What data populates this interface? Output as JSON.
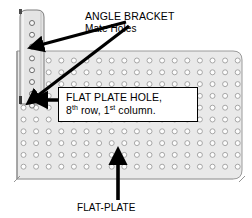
{
  "diagram": {
    "background_color": "#ffffff",
    "plate": {
      "name": "FLAT-PLATE",
      "fill_color": "#e9e9e9",
      "edge_color": "#9a9a9a",
      "hole_fill": "#fdfdfd",
      "hole_stroke": "#9d9d9d",
      "columns": 18,
      "rows": 12,
      "hole_diameter_px": 5,
      "column_spacing_px": 12.6,
      "row_spacing_px": 11.8,
      "corner_radius_px": 9
    },
    "bracket": {
      "name": "ANGLE BRACKET",
      "fill_color": "#e4e4e4",
      "edge_color": "#7d7d7d",
      "holes": 8,
      "hole_diameter_px": 5,
      "hole_spacing_px": 11.8,
      "corner_radius_px": 9
    },
    "arrow_color": "#000000"
  },
  "annotations": {
    "angle_bracket": {
      "title": "ANGLE BRACKET",
      "subtitle": "Mate Holes"
    },
    "flat_plate_hole": {
      "line1": "FLAT PLATE HOLE,",
      "line2_prefix": "8",
      "line2_sup1": "th",
      "line2_mid": " row, 1",
      "line2_sup2": "st",
      "line2_suffix": " column.",
      "line2_plain": "8th row, 1st column."
    },
    "flat_plate": {
      "label": "FLAT-PLATE"
    }
  },
  "arrows": [
    {
      "name": "arrow-to-bracket-hole-upper",
      "from": [
        126,
        22
      ],
      "to": [
        36,
        47
      ]
    },
    {
      "name": "arrow-to-bracket-hole-lower",
      "from": [
        128,
        25
      ],
      "to": [
        32,
        99
      ]
    },
    {
      "name": "arrow-to-flat-plate-hole",
      "from": [
        92,
        100
      ],
      "to": [
        40,
        100
      ]
    },
    {
      "name": "arrow-to-flat-plate",
      "from": [
        118,
        200
      ],
      "to": [
        118,
        157
      ]
    }
  ]
}
